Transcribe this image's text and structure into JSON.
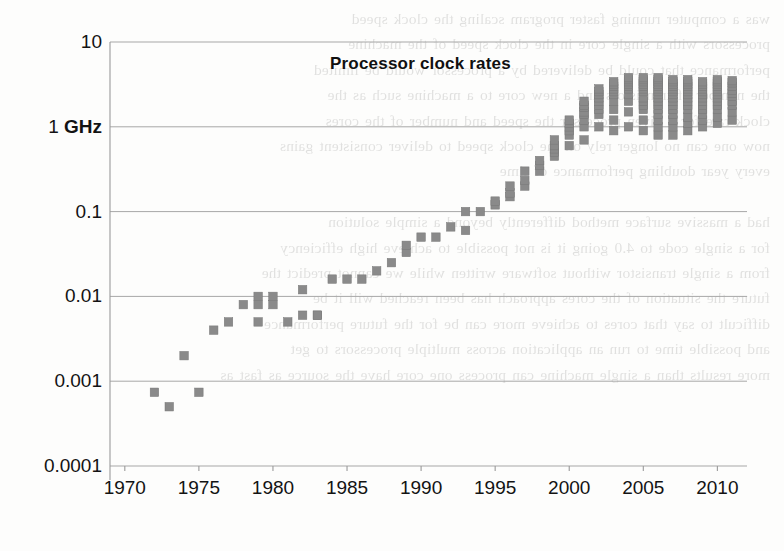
{
  "figure": {
    "title": "Processor clock rates",
    "background": "#fdfdfc",
    "marker_color": "#8a8a8a",
    "grid_color": "#a7a7a7",
    "axis_color": "#9a9a9a"
  },
  "ghost_text": "was a computer running faster program scaling the clock speed\nprocessors with a single core in the clock speed of the machine\nperformance that could be delivered by a processor would be limited\nthe number of transistors and a new core to a machine such as the\nclock rate for a given processor the speed and number of the cores\nnow one can no longer rely on the clock speed to deliver consistent gains\nevery year doubling performance of time\n\nhad a massive surface method differently beyond a simple solution\nfor a single code to 4.0 going it is not possible to achieve high efficiency\nfrom a single transistor without software written while we cannot predict the\nfuture the situation of the cores approach has been reached will it be\ndifficult to say that cores to achieve more can be for the future performance\nand possible time to run an application across multiple processors to get\nmore results than a single machine can process one core have the source as fast as",
  "chart_data": {
    "type": "scatter",
    "title": "Processor clock rates",
    "xlabel": "",
    "ylabel": "",
    "xlim": [
      1969,
      2012
    ],
    "ylim": [
      0.0001,
      10
    ],
    "yscale": "log",
    "grid": true,
    "legend": false,
    "xticks": [
      1970,
      1975,
      1980,
      1985,
      1990,
      1995,
      2000,
      2005,
      2010
    ],
    "xtick_labels": [
      "1970",
      "1975",
      "1980",
      "1985",
      "1990",
      "1995",
      "2000",
      "2005",
      "2010"
    ],
    "yticks": [
      10,
      1,
      0.1,
      0.01,
      0.001,
      0.0001
    ],
    "ytick_labels": [
      "10",
      "1 GHz",
      "0.1",
      "0.01",
      "0.001",
      "0.0001"
    ],
    "units": "GHz",
    "series": [
      {
        "name": "Processor clock rate",
        "marker": "square",
        "color": "#8a8a8a",
        "points": [
          [
            1972,
            0.00074
          ],
          [
            1973,
            0.0005
          ],
          [
            1974,
            0.002
          ],
          [
            1975,
            0.00074
          ],
          [
            1976,
            0.004
          ],
          [
            1977,
            0.005
          ],
          [
            1978,
            0.008
          ],
          [
            1979,
            0.005
          ],
          [
            1979,
            0.01
          ],
          [
            1979,
            0.008
          ],
          [
            1980,
            0.01
          ],
          [
            1980,
            0.008
          ],
          [
            1981,
            0.005
          ],
          [
            1982,
            0.006
          ],
          [
            1982,
            0.012
          ],
          [
            1983,
            0.006
          ],
          [
            1983,
            0.006
          ],
          [
            1984,
            0.016
          ],
          [
            1985,
            0.016
          ],
          [
            1986,
            0.016
          ],
          [
            1987,
            0.02
          ],
          [
            1988,
            0.025
          ],
          [
            1989,
            0.033
          ],
          [
            1989,
            0.04
          ],
          [
            1990,
            0.05
          ],
          [
            1991,
            0.05
          ],
          [
            1992,
            0.066
          ],
          [
            1993,
            0.06
          ],
          [
            1993,
            0.1
          ],
          [
            1994,
            0.1
          ],
          [
            1995,
            0.12
          ],
          [
            1995,
            0.133
          ],
          [
            1996,
            0.15
          ],
          [
            1996,
            0.166
          ],
          [
            1996,
            0.2
          ],
          [
            1997,
            0.2
          ],
          [
            1997,
            0.233
          ],
          [
            1997,
            0.3
          ],
          [
            1998,
            0.3
          ],
          [
            1998,
            0.35
          ],
          [
            1998,
            0.4
          ],
          [
            1999,
            0.45
          ],
          [
            1999,
            0.5
          ],
          [
            1999,
            0.55
          ],
          [
            1999,
            0.6
          ],
          [
            1999,
            0.7
          ],
          [
            2000,
            0.6
          ],
          [
            2000,
            0.8
          ],
          [
            2000,
            0.9
          ],
          [
            2000,
            1.0
          ],
          [
            2000,
            1.1
          ],
          [
            2000,
            1.2
          ],
          [
            2001,
            0.7
          ],
          [
            2001,
            1.0
          ],
          [
            2001,
            1.2
          ],
          [
            2001,
            1.4
          ],
          [
            2001,
            1.5
          ],
          [
            2001,
            1.7
          ],
          [
            2001,
            1.8
          ],
          [
            2001,
            2.0
          ],
          [
            2002,
            1.0
          ],
          [
            2002,
            1.4
          ],
          [
            2002,
            1.6
          ],
          [
            2002,
            1.8
          ],
          [
            2002,
            2.0
          ],
          [
            2002,
            2.2
          ],
          [
            2002,
            2.4
          ],
          [
            2002,
            2.6
          ],
          [
            2002,
            2.8
          ],
          [
            2003,
            0.9
          ],
          [
            2003,
            1.2
          ],
          [
            2003,
            1.6
          ],
          [
            2003,
            2.0
          ],
          [
            2003,
            2.4
          ],
          [
            2003,
            2.6
          ],
          [
            2003,
            2.8
          ],
          [
            2003,
            3.0
          ],
          [
            2003,
            3.2
          ],
          [
            2003,
            3.4
          ],
          [
            2004,
            1.0
          ],
          [
            2004,
            1.5
          ],
          [
            2004,
            2.0
          ],
          [
            2004,
            2.4
          ],
          [
            2004,
            2.8
          ],
          [
            2004,
            3.0
          ],
          [
            2004,
            3.2
          ],
          [
            2004,
            3.4
          ],
          [
            2004,
            3.6
          ],
          [
            2004,
            3.8
          ],
          [
            2005,
            0.9
          ],
          [
            2005,
            1.2
          ],
          [
            2005,
            1.6
          ],
          [
            2005,
            1.8
          ],
          [
            2005,
            2.0
          ],
          [
            2005,
            2.2
          ],
          [
            2005,
            2.6
          ],
          [
            2005,
            2.8
          ],
          [
            2005,
            3.0
          ],
          [
            2005,
            3.2
          ],
          [
            2005,
            3.4
          ],
          [
            2005,
            3.6
          ],
          [
            2005,
            3.8
          ],
          [
            2006,
            0.8
          ],
          [
            2006,
            1.0
          ],
          [
            2006,
            1.2
          ],
          [
            2006,
            1.4
          ],
          [
            2006,
            1.6
          ],
          [
            2006,
            1.8
          ],
          [
            2006,
            2.0
          ],
          [
            2006,
            2.2
          ],
          [
            2006,
            2.4
          ],
          [
            2006,
            2.6
          ],
          [
            2006,
            2.8
          ],
          [
            2006,
            3.0
          ],
          [
            2006,
            3.2
          ],
          [
            2006,
            3.4
          ],
          [
            2006,
            3.6
          ],
          [
            2006,
            3.8
          ],
          [
            2007,
            0.8
          ],
          [
            2007,
            1.0
          ],
          [
            2007,
            1.2
          ],
          [
            2007,
            1.4
          ],
          [
            2007,
            1.6
          ],
          [
            2007,
            1.8
          ],
          [
            2007,
            2.0
          ],
          [
            2007,
            2.2
          ],
          [
            2007,
            2.4
          ],
          [
            2007,
            2.6
          ],
          [
            2007,
            2.8
          ],
          [
            2007,
            3.0
          ],
          [
            2007,
            3.2
          ],
          [
            2007,
            3.4
          ],
          [
            2007,
            3.6
          ],
          [
            2008,
            0.9
          ],
          [
            2008,
            1.1
          ],
          [
            2008,
            1.3
          ],
          [
            2008,
            1.6
          ],
          [
            2008,
            1.8
          ],
          [
            2008,
            2.0
          ],
          [
            2008,
            2.2
          ],
          [
            2008,
            2.4
          ],
          [
            2008,
            2.6
          ],
          [
            2008,
            2.8
          ],
          [
            2008,
            3.0
          ],
          [
            2008,
            3.2
          ],
          [
            2008,
            3.4
          ],
          [
            2008,
            3.6
          ],
          [
            2009,
            1.0
          ],
          [
            2009,
            1.2
          ],
          [
            2009,
            1.4
          ],
          [
            2009,
            1.6
          ],
          [
            2009,
            1.8
          ],
          [
            2009,
            2.0
          ],
          [
            2009,
            2.2
          ],
          [
            2009,
            2.4
          ],
          [
            2009,
            2.6
          ],
          [
            2009,
            2.8
          ],
          [
            2009,
            3.0
          ],
          [
            2009,
            3.2
          ],
          [
            2009,
            3.4
          ],
          [
            2010,
            1.1
          ],
          [
            2010,
            1.3
          ],
          [
            2010,
            1.6
          ],
          [
            2010,
            1.8
          ],
          [
            2010,
            2.0
          ],
          [
            2010,
            2.2
          ],
          [
            2010,
            2.4
          ],
          [
            2010,
            2.6
          ],
          [
            2010,
            2.8
          ],
          [
            2010,
            3.0
          ],
          [
            2010,
            3.2
          ],
          [
            2010,
            3.4
          ],
          [
            2010,
            3.6
          ],
          [
            2011,
            1.2
          ],
          [
            2011,
            1.5
          ],
          [
            2011,
            1.8
          ],
          [
            2011,
            2.0
          ],
          [
            2011,
            2.3
          ],
          [
            2011,
            2.5
          ],
          [
            2011,
            2.7
          ],
          [
            2011,
            3.0
          ],
          [
            2011,
            3.3
          ],
          [
            2011,
            3.5
          ]
        ]
      }
    ],
    "annotations": [
      {
        "text": "Processor clock rates",
        "role": "title",
        "x": 2002,
        "y": 6.0
      }
    ]
  },
  "plot_geometry": {
    "left": 110,
    "right": 747,
    "top": 42,
    "bottom": 466,
    "title_x": 330,
    "title_y": 54
  }
}
